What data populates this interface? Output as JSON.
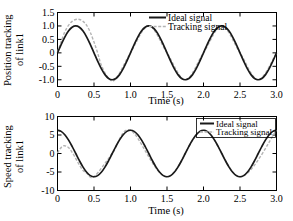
{
  "figure": {
    "background": "#ffffff",
    "foreground": "#000000",
    "ideal_color": "#1a1a1a",
    "tracking_color": "#b4b4b4"
  },
  "panels": [
    {
      "id": "position",
      "ylabel": "Position tracking\nof link1",
      "xlabel": "Time (s)",
      "legend": {
        "ideal": "Ideal  signal",
        "tracking": "Tracking signal",
        "box": false
      }
    },
    {
      "id": "speed",
      "ylabel": "Speed tracking\nof link1",
      "xlabel": "Time (s)",
      "legend": {
        "ideal": "Ideal  signal",
        "tracking": "Tracking signal",
        "box": true
      }
    }
  ],
  "chart_data": [
    {
      "type": "line",
      "id": "position-tracking-chart",
      "title": "",
      "xlabel": "Time (s)",
      "ylabel": "Position tracking of link1",
      "xlim": [
        0,
        3.0
      ],
      "ylim": [
        -1.25,
        1.5
      ],
      "xticks": [
        0,
        0.5,
        1.0,
        1.5,
        2.0,
        2.5,
        3.0
      ],
      "xticklabels": [
        "0",
        "0.5",
        "1.0",
        "1.5",
        "2.0",
        "2.5",
        "3.0"
      ],
      "yticks": [
        -1.0,
        -0.5,
        0,
        0.5,
        1.0,
        1.5
      ],
      "yticklabels": [
        "-1.0",
        "-0.5",
        "0",
        "0.5",
        "1.0",
        "1.5"
      ],
      "grid": false,
      "legend_position": "upper center",
      "series": [
        {
          "name": "Ideal  signal",
          "style": "solid",
          "color": "#1a1a1a",
          "formula": "sin(2*pi*t)",
          "x": [
            0,
            0.05,
            0.1,
            0.15,
            0.2,
            0.25,
            0.3,
            0.35,
            0.4,
            0.45,
            0.5,
            0.55,
            0.6,
            0.65,
            0.7,
            0.75,
            0.8,
            0.85,
            0.9,
            0.95,
            1.0,
            1.05,
            1.1,
            1.15,
            1.2,
            1.25,
            1.3,
            1.35,
            1.4,
            1.45,
            1.5,
            1.55,
            1.6,
            1.65,
            1.7,
            1.75,
            1.8,
            1.85,
            1.9,
            1.95,
            2.0,
            2.05,
            2.1,
            2.15,
            2.2,
            2.25,
            2.3,
            2.35,
            2.4,
            2.45,
            2.5,
            2.55,
            2.6,
            2.65,
            2.7,
            2.75,
            2.8,
            2.85,
            2.9,
            2.95,
            3.0
          ],
          "y": [
            0,
            0.309,
            0.588,
            0.809,
            0.951,
            1.0,
            0.951,
            0.809,
            0.588,
            0.309,
            0,
            -0.309,
            -0.588,
            -0.809,
            -0.951,
            -1.0,
            -0.951,
            -0.809,
            -0.588,
            -0.309,
            0,
            0.309,
            0.588,
            0.809,
            0.951,
            1.0,
            0.951,
            0.809,
            0.588,
            0.309,
            0,
            -0.309,
            -0.588,
            -0.809,
            -0.951,
            -1.0,
            -0.951,
            -0.809,
            -0.588,
            -0.309,
            0,
            0.309,
            0.588,
            0.809,
            0.951,
            1.0,
            0.951,
            0.809,
            0.588,
            0.309,
            0,
            -0.309,
            -0.588,
            -0.809,
            -0.951,
            -1.0,
            -0.951,
            -0.809,
            -0.588,
            -0.309,
            0
          ]
        },
        {
          "name": "Tracking signal",
          "style": "dashed",
          "color": "#b4b4b4",
          "note": "overshoots ideal during initial transient t<0.6, then coincides",
          "x": [
            0,
            0.05,
            0.1,
            0.15,
            0.2,
            0.25,
            0.3,
            0.35,
            0.4,
            0.45,
            0.5,
            0.55,
            0.6,
            0.7,
            0.8,
            1.0,
            1.25,
            1.5,
            1.75,
            2.0,
            2.25,
            2.5,
            2.75,
            3.0
          ],
          "y": [
            0.02,
            0.42,
            0.78,
            1.02,
            1.17,
            1.24,
            1.24,
            1.17,
            1.02,
            0.76,
            0.4,
            0.0,
            -0.45,
            -0.95,
            -0.96,
            0.0,
            1.0,
            0.0,
            -1.0,
            0.0,
            1.0,
            0.0,
            -1.0,
            0.0
          ]
        }
      ]
    },
    {
      "type": "line",
      "id": "speed-tracking-chart",
      "title": "",
      "xlabel": "Time (s)",
      "ylabel": "Speed tracking of link1",
      "xlim": [
        0,
        3.0
      ],
      "ylim": [
        -10,
        10
      ],
      "xticks": [
        0,
        0.5,
        1.0,
        1.5,
        2.0,
        2.5,
        3.0
      ],
      "xticklabels": [
        "0",
        "0.5",
        "1.0",
        "1.5",
        "2.0",
        "2.5",
        "3.0"
      ],
      "yticks": [
        -10,
        -5,
        0,
        5,
        10
      ],
      "yticklabels": [
        "-10",
        "-5",
        "0",
        "5",
        "10"
      ],
      "grid": false,
      "legend_position": "upper right",
      "series": [
        {
          "name": "Ideal  signal",
          "style": "solid",
          "color": "#1a1a1a",
          "formula": "2*pi*cos(2*pi*t)",
          "x": [
            0,
            0.05,
            0.1,
            0.15,
            0.2,
            0.25,
            0.3,
            0.35,
            0.4,
            0.45,
            0.5,
            0.55,
            0.6,
            0.65,
            0.7,
            0.75,
            0.8,
            0.85,
            0.9,
            0.95,
            1.0,
            1.05,
            1.1,
            1.15,
            1.2,
            1.25,
            1.3,
            1.35,
            1.4,
            1.45,
            1.5,
            1.55,
            1.6,
            1.65,
            1.7,
            1.75,
            1.8,
            1.85,
            1.9,
            1.95,
            2.0,
            2.05,
            2.1,
            2.15,
            2.2,
            2.25,
            2.3,
            2.35,
            2.4,
            2.45,
            2.5,
            2.55,
            2.6,
            2.65,
            2.7,
            2.75,
            2.8,
            2.85,
            2.9,
            2.95,
            3.0
          ],
          "y": [
            6.28,
            5.98,
            5.08,
            3.69,
            1.94,
            0,
            -1.94,
            -3.69,
            -5.08,
            -5.98,
            -6.28,
            -5.98,
            -5.08,
            -3.69,
            -1.94,
            0,
            1.94,
            3.69,
            5.08,
            5.98,
            6.28,
            5.98,
            5.08,
            3.69,
            1.94,
            0,
            -1.94,
            -3.69,
            -5.08,
            -5.98,
            -6.28,
            -5.98,
            -5.08,
            -3.69,
            -1.94,
            0,
            1.94,
            3.69,
            5.08,
            5.98,
            6.28,
            5.98,
            5.08,
            3.69,
            1.94,
            0,
            -1.94,
            -3.69,
            -5.08,
            -5.98,
            -6.28,
            -5.98,
            -5.08,
            -3.69,
            -1.94,
            0,
            1.94,
            3.69,
            5.08,
            5.98,
            6.28
          ]
        },
        {
          "name": "Tracking signal",
          "style": "dashed",
          "color": "#b4b4b4",
          "note": "starts near 0, small hump ~2 at t=0.1, converges to ideal by t~0.35",
          "x": [
            0,
            0.03,
            0.06,
            0.09,
            0.12,
            0.15,
            0.18,
            0.22,
            0.26,
            0.3,
            0.35,
            0.4,
            0.5,
            0.75,
            1.0,
            1.5,
            2.0,
            2.5,
            3.0
          ],
          "y": [
            0.1,
            1.1,
            1.8,
            2.1,
            2.0,
            1.6,
            0.9,
            -0.3,
            -1.7,
            -3.1,
            -4.6,
            -5.3,
            -6.28,
            0,
            6.28,
            -6.28,
            6.28,
            -6.28,
            6.28
          ]
        }
      ]
    }
  ]
}
